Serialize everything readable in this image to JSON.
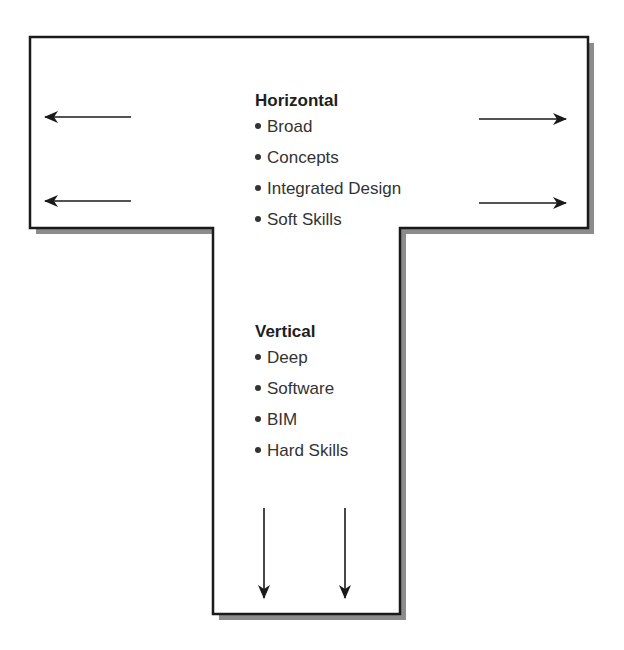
{
  "diagram": {
    "type": "T-shaped skills diagram",
    "colors": {
      "outline": "#1a1a1a",
      "shadow": "#8c8c8c",
      "fill": "#ffffff",
      "arrow": "#1a1a1a"
    },
    "horizontal": {
      "title": "Horizontal",
      "items": [
        "Broad",
        "Concepts",
        "Integrated Design",
        "Soft Skills"
      ],
      "arrows": [
        "left",
        "left",
        "right",
        "right"
      ]
    },
    "vertical": {
      "title": "Vertical",
      "items": [
        "Deep",
        "Software",
        "BIM",
        "Hard Skills"
      ],
      "arrows": [
        "down",
        "down"
      ]
    }
  }
}
